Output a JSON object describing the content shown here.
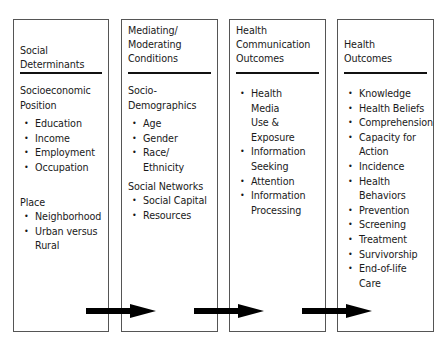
{
  "diagram": {
    "columns": [
      {
        "title": "Social Determinants",
        "title_lines": [
          "Social",
          "Determinants"
        ],
        "sections": [
          {
            "label_lines": [
              "Socioeconomic",
              "Position"
            ],
            "items": [
              "Education",
              "Income",
              "Employment",
              "Occupation"
            ]
          },
          {
            "label_lines": [
              "Place"
            ],
            "items": [
              "Neighborhood",
              "Urban versus Rural"
            ]
          }
        ]
      },
      {
        "title": "Mediating/Moderating Conditions",
        "title_lines": [
          "Mediating/",
          "Moderating",
          "Conditions"
        ],
        "sections": [
          {
            "label_lines": [
              "Socio-",
              "Demographics"
            ],
            "items": [
              "Age",
              "Gender",
              "Race/ Ethnicity"
            ]
          },
          {
            "label_lines": [
              "Social Networks"
            ],
            "items": [
              "Social Capital",
              "Resources"
            ]
          }
        ]
      },
      {
        "title": "Health Communication Outcomes",
        "title_lines": [
          "Health",
          "Communication",
          "Outcomes"
        ],
        "sections": [
          {
            "label_lines": [],
            "items": [
              "Health Media Use & Exposure",
              "Information Seeking",
              "Attention",
              "Information Processing"
            ]
          }
        ]
      },
      {
        "title": "Health Outcomes",
        "title_lines": [
          "Health",
          "Outcomes"
        ],
        "sections": [
          {
            "label_lines": [],
            "items": [
              "Knowledge",
              "Health Beliefs",
              "Comprehension",
              "Capacity for Action",
              "Incidence",
              "Health Behaviors",
              "Prevention",
              "Screening",
              "Treatment",
              "Survivorship",
              "End-of-life Care"
            ]
          }
        ]
      }
    ],
    "arrows": [
      {
        "from": "Social Determinants",
        "to": "Mediating/Moderating Conditions"
      },
      {
        "from": "Mediating/Moderating Conditions",
        "to": "Health Communication Outcomes"
      },
      {
        "from": "Health Communication Outcomes",
        "to": "Health Outcomes"
      }
    ],
    "colors": {
      "border": "#555555",
      "rule": "#111111",
      "arrow": "#000000",
      "text": "#1a1a1a"
    }
  }
}
